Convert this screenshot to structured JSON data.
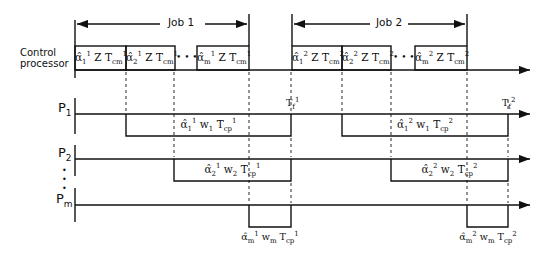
{
  "diagram": {
    "rows": {
      "control": {
        "label_line1": "Control",
        "label_line2": "processor"
      },
      "p1": {
        "label": "P",
        "sub": "1"
      },
      "p2": {
        "label": "P",
        "sub": "2"
      },
      "dots": "•\n•\n•",
      "pm": {
        "label": "P",
        "sub": "m"
      }
    },
    "jobs": [
      {
        "label": "Job 1"
      },
      {
        "label": "Job 2"
      }
    ],
    "control_boxes": [
      {
        "text": "α̂₁¹ Z Tₘ₁",
        "alpha": "α̂",
        "sub": "1",
        "sup": "1",
        "mid": " Z T",
        "tsub": "cm",
        "tsup": "1"
      },
      {
        "alpha": "α̂",
        "sub": "2",
        "sup": "1",
        "mid": " Z T",
        "tsub": "cm",
        "tsup": "1"
      },
      {
        "alpha": "α̂",
        "sub": "m",
        "sup": "1",
        "mid": " Z T",
        "tsub": "cm",
        "tsup": "1"
      },
      {
        "alpha": "α̂",
        "sub": "1",
        "sup": "2",
        "mid": " Z T",
        "tsub": "cm",
        "tsup": "2"
      },
      {
        "alpha": "α̂",
        "sub": "2",
        "sup": "2",
        "mid": " Z T",
        "tsub": "cm",
        "tsup": "2"
      },
      {
        "alpha": "α̂",
        "sub": "m",
        "sup": "2",
        "mid": " Z T",
        "tsub": "cm",
        "tsup": "2"
      }
    ],
    "ellipsis": "• • •",
    "compute_boxes": [
      {
        "alpha": "α̂",
        "sub": "1",
        "sup": "1",
        "w": " w",
        "wsub": "1",
        "t": " T",
        "tsub": "cp",
        "tsup": "1"
      },
      {
        "alpha": "α̂",
        "sub": "2",
        "sup": "1",
        "w": " w",
        "wsub": "2",
        "t": " T",
        "tsub": "cp",
        "tsup": "1"
      },
      {
        "alpha": "α̂",
        "sub": "m",
        "sup": "1",
        "w": " w",
        "wsub": "m",
        "t": " T",
        "tsub": "cp",
        "tsup": "1"
      },
      {
        "alpha": "α̂",
        "sub": "1",
        "sup": "2",
        "w": " w",
        "wsub": "1",
        "t": " T",
        "tsub": "cp",
        "tsup": "2"
      },
      {
        "alpha": "α̂",
        "sub": "2",
        "sup": "2",
        "w": " w",
        "wsub": "2",
        "t": " T",
        "tsub": "cp",
        "tsup": "2"
      },
      {
        "alpha": "α̂",
        "sub": "m",
        "sup": "2",
        "w": " w",
        "wsub": "m",
        "t": " T",
        "tsub": "cp",
        "tsup": "2"
      }
    ],
    "finish_markers": [
      {
        "t": "T",
        "sub": "f",
        "sup": "1"
      },
      {
        "t": "T",
        "sub": "f",
        "sup": "2"
      }
    ]
  }
}
